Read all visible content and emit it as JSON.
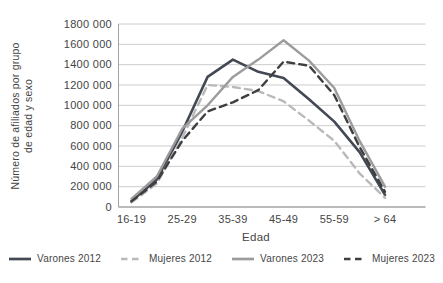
{
  "chart_data": {
    "type": "line",
    "title": "",
    "xlabel": "Edad",
    "ylabel": "Número de afiliados por grupo de edad y sexo",
    "ylabel_line1": "Número de afiliados por grupo",
    "ylabel_line2": "de edad y sexo",
    "categories": [
      "16-19",
      "20-24",
      "25-29",
      "30-34",
      "35-39",
      "40-44",
      "45-49",
      "50-54",
      "55-59",
      "60-64",
      "> 64"
    ],
    "x_tick_labels": [
      "16-19",
      "25-29",
      "35-39",
      "45-49",
      "55-59",
      "> 64"
    ],
    "y_axis": {
      "min": 0,
      "max": 1800000,
      "step": 200000,
      "tick_labels": [
        "0",
        "200 000",
        "400 000",
        "600 000",
        "800 000",
        "1000 000",
        "1200 000",
        "1400 000",
        "1600 000",
        "1800 000"
      ]
    },
    "grid": true,
    "legend_position": "bottom",
    "series": [
      {
        "name": "Varones 2012",
        "color": "#424854",
        "line_style": "solid",
        "values": [
          60000,
          270000,
          740000,
          1280000,
          1450000,
          1330000,
          1270000,
          1060000,
          840000,
          540000,
          120000
        ]
      },
      {
        "name": "Mujeres 2012",
        "color": "#b9b9b9",
        "line_style": "dashed",
        "values": [
          45000,
          230000,
          680000,
          1200000,
          1180000,
          1140000,
          1040000,
          850000,
          650000,
          330000,
          90000
        ]
      },
      {
        "name": "Varones 2023",
        "color": "#9c9c9c",
        "line_style": "solid",
        "values": [
          80000,
          300000,
          770000,
          1000000,
          1280000,
          1450000,
          1640000,
          1440000,
          1170000,
          650000,
          200000
        ]
      },
      {
        "name": "Mujeres 2023",
        "color": "#3e3e3e",
        "line_style": "dashed",
        "values": [
          55000,
          250000,
          650000,
          940000,
          1030000,
          1150000,
          1430000,
          1390000,
          1100000,
          590000,
          150000
        ]
      }
    ]
  },
  "colors": {
    "background": "#ffffff",
    "grid": "#cccccc",
    "axis": "#a3a3a3",
    "text": "#454545"
  }
}
